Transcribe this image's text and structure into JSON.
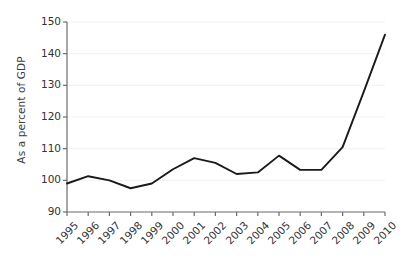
{
  "chart_data": {
    "type": "line",
    "title": "",
    "xlabel": "",
    "ylabel": "As a percent of GDP",
    "categories": [
      "1995",
      "1996",
      "1997",
      "1998",
      "1999",
      "2000",
      "2001",
      "2002",
      "2003",
      "2004",
      "2005",
      "2006",
      "2007",
      "2008",
      "2009",
      "2010"
    ],
    "values": [
      99.0,
      101.3,
      100.0,
      97.5,
      99.0,
      103.5,
      107.0,
      105.5,
      102.0,
      102.5,
      107.8,
      103.3,
      103.3,
      110.5,
      128.0,
      146.0
    ],
    "series": [
      {
        "name": "",
        "values": [
          99.0,
          101.3,
          100.0,
          97.5,
          99.0,
          103.5,
          107.0,
          105.5,
          102.0,
          102.5,
          107.8,
          103.3,
          103.3,
          110.5,
          128.0,
          146.0
        ]
      }
    ],
    "ylim": [
      90,
      150
    ],
    "yticks": [
      90,
      100,
      110,
      120,
      130,
      140,
      150
    ],
    "ytick_labels": [
      "90",
      "100",
      "110",
      "120",
      "130",
      "140",
      "150"
    ],
    "grid": true,
    "grid_axis": "y",
    "legend": false,
    "legend_position": "none",
    "line_color": "#1a1a1a",
    "grid_color": "#f2f2f2",
    "axis_color": "#6b6b6b",
    "background_color": "#ffffff"
  }
}
